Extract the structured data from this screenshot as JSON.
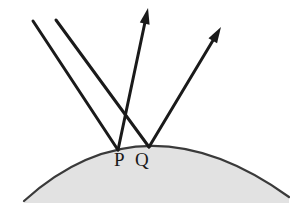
{
  "figure": {
    "background_color": "#ffffff",
    "surface": {
      "name": "convex-curved-surface",
      "fill_color": "#e2e2e2",
      "stroke_color": "#3a3a3a",
      "stroke_width": 2.2,
      "left_end": [
        24,
        201
      ],
      "right_end": [
        289,
        197
      ],
      "apex": [
        150,
        146
      ],
      "baseline_y": 203
    },
    "labels": [
      {
        "id": "P",
        "text": "P",
        "x": 114,
        "y": 166,
        "color": "#1a1a1a"
      },
      {
        "id": "Q",
        "text": "Q",
        "x": 135,
        "y": 166,
        "color": "#1a1a1a"
      }
    ],
    "points": [
      {
        "id": "P",
        "x": 118,
        "y": 150
      },
      {
        "id": "Q",
        "x": 149,
        "y": 147
      }
    ],
    "rays": [
      {
        "name": "incident-ray-1",
        "kind": "incident",
        "from": [
          33,
          21
        ],
        "to": [
          118,
          150
        ],
        "arrowhead": false,
        "color": "#1a1a1a",
        "width": 3.0
      },
      {
        "name": "incident-ray-2",
        "kind": "incident",
        "from": [
          56,
          20
        ],
        "to": [
          149,
          147
        ],
        "arrowhead": false,
        "color": "#1a1a1a",
        "width": 3.0
      },
      {
        "name": "reflected-ray-1",
        "kind": "reflected",
        "from": [
          118,
          150
        ],
        "to": [
          148,
          8
        ],
        "arrowhead": true,
        "color": "#1a1a1a",
        "width": 3.0
      },
      {
        "name": "reflected-ray-2",
        "kind": "reflected",
        "from": [
          149,
          147
        ],
        "to": [
          221,
          27
        ],
        "arrowhead": true,
        "color": "#1a1a1a",
        "width": 3.0
      }
    ],
    "arrowhead_style": {
      "shape": "solid-triangle",
      "length": 16,
      "half_width": 5
    }
  }
}
